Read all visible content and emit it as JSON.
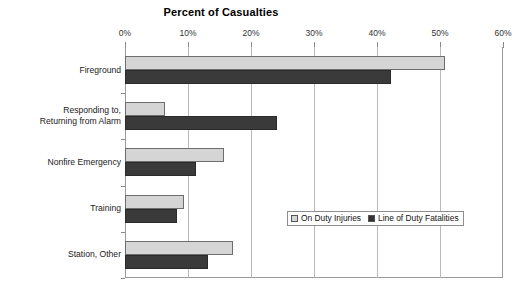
{
  "chart_data": {
    "type": "bar",
    "orientation": "horizontal",
    "title": "Percent of Casualties",
    "xlabel": "",
    "ylabel": "",
    "xlim": [
      0,
      60
    ],
    "xticks": [
      0,
      10,
      20,
      30,
      40,
      50,
      60
    ],
    "xtick_labels": [
      "0%",
      "10%",
      "20%",
      "30%",
      "40%",
      "50%",
      "60%"
    ],
    "grid": true,
    "grid_axis": "x",
    "legend_position": "inside-right-lower",
    "categories": [
      "Fireground",
      "Responding to,\nReturning from Alarm",
      "Nonfire Emergency",
      "Training",
      "Station, Other"
    ],
    "category_labels": [
      {
        "line1": "Fireground",
        "line2": ""
      },
      {
        "line1": "Responding to,",
        "line2": "Returning from Alarm"
      },
      {
        "line1": "Nonfire Emergency",
        "line2": ""
      },
      {
        "line1": "Training",
        "line2": ""
      },
      {
        "line1": "Station, Other",
        "line2": ""
      }
    ],
    "series": [
      {
        "name": "On Duty Injuries",
        "color": "#d5d5d5",
        "values": [
          50.8,
          6.3,
          15.7,
          9.4,
          17.1
        ]
      },
      {
        "name": "Line of Duty Fatalities",
        "color": "#3a3a3a",
        "values": [
          42.3,
          24.2,
          11.2,
          8.2,
          13.1
        ]
      }
    ]
  },
  "legend": {
    "entries": [
      {
        "label": "On Duty Injuries",
        "swatch": "injuries"
      },
      {
        "label": "Line of Duty Fatalities",
        "swatch": "fatalities"
      }
    ]
  },
  "colors": {
    "injuries": "#d5d5d5",
    "fatalities": "#3a3a3a",
    "frame": "#9a9a9a",
    "gridline": "#b9b9b9"
  }
}
